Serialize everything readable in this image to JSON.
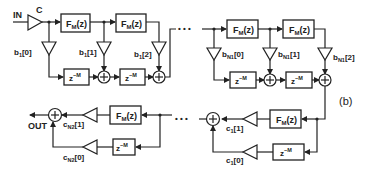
{
  "figure_label": "(b)",
  "input_label": "IN",
  "output_label": "OUT",
  "input_gain_label": "C",
  "block_labels": {
    "filter": "F",
    "filter_sub": "M",
    "filter_arg": "(z)",
    "delay": "z",
    "delay_exp": "−M"
  },
  "top_section_1": {
    "coeffs": [
      {
        "base": "b",
        "sub": "1",
        "idx": "[0]"
      },
      {
        "base": "b",
        "sub": "1",
        "idx": "[1]"
      },
      {
        "base": "b",
        "sub": "1",
        "idx": "[2]"
      }
    ]
  },
  "top_section_n1": {
    "coeffs": [
      {
        "base": "b",
        "sub": "N1",
        "idx": "[0]"
      },
      {
        "base": "b",
        "sub": "N1",
        "idx": "[1]"
      },
      {
        "base": "b",
        "sub": "N1",
        "idx": "[2]"
      }
    ]
  },
  "bottom_section_1": {
    "coeffs": [
      {
        "base": "c",
        "sub": "1",
        "idx": "[1]"
      },
      {
        "base": "c",
        "sub": "1",
        "idx": "[0]"
      }
    ]
  },
  "bottom_section_n2": {
    "coeffs": [
      {
        "base": "c",
        "sub": "N2",
        "idx": "[1]"
      },
      {
        "base": "c",
        "sub": "N2",
        "idx": "[0]"
      }
    ]
  },
  "ellipsis": "• • •"
}
